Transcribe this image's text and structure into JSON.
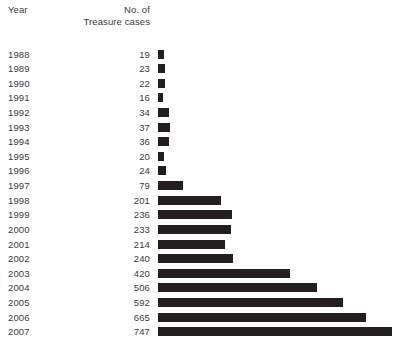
{
  "columns": {
    "year_label": "Year",
    "count_label_line1": "No. of",
    "count_label_line2": "Treasure cases"
  },
  "chart_data": {
    "type": "bar",
    "orientation": "horizontal",
    "title": "",
    "xlabel": "",
    "ylabel": "Year",
    "grid": false,
    "legend": null,
    "bar_color": "#231f20",
    "text_color": "#3a3a3c",
    "background": "#ffffff",
    "xlim": [
      0,
      747
    ],
    "categories": [
      "1988",
      "1989",
      "1990",
      "1991",
      "1992",
      "1993",
      "1994",
      "1995",
      "1996",
      "1997",
      "1998",
      "1999",
      "2000",
      "2001",
      "2002",
      "2003",
      "2004",
      "2005",
      "2006",
      "2007"
    ],
    "values": [
      19,
      23,
      22,
      16,
      34,
      37,
      36,
      20,
      24,
      79,
      201,
      236,
      233,
      214,
      240,
      420,
      506,
      592,
      665,
      747
    ],
    "value_labels": [
      "19",
      "23",
      "22",
      "16",
      "34",
      "37",
      "36",
      "20",
      "24",
      "79",
      "201",
      "236",
      "233",
      "214",
      "240",
      "420",
      "506",
      "592",
      "665",
      "747"
    ]
  }
}
